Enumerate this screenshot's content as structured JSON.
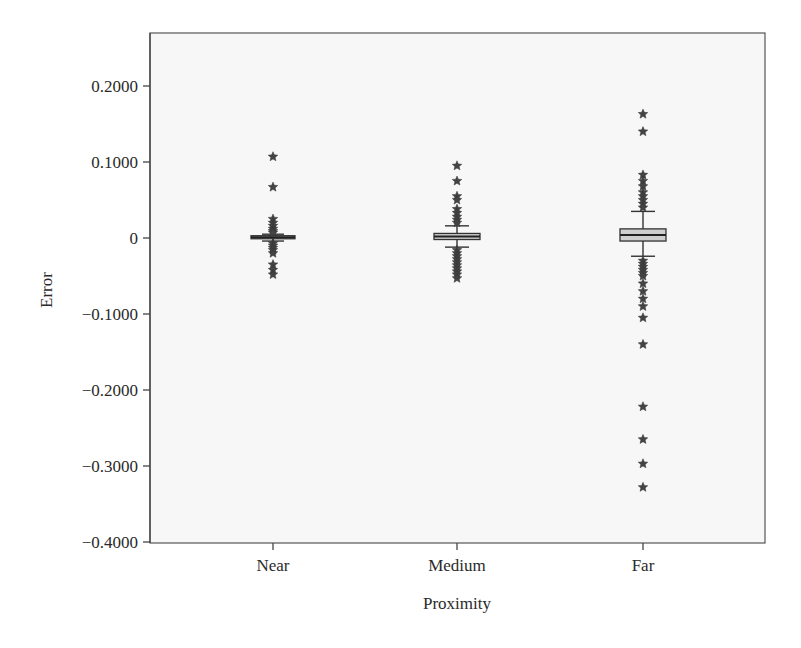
{
  "chart_data": {
    "type": "box",
    "title": "",
    "xlabel": "Proximity",
    "ylabel": "Error",
    "ylim": [
      -0.4,
      0.25
    ],
    "yticks": [
      0.2,
      0.1,
      0,
      -0.1,
      -0.2,
      -0.3,
      -0.4
    ],
    "ytick_labels": [
      "0.2000",
      "0.1000",
      "0",
      "−0.1000",
      "−0.2000",
      "−0.3000",
      "−0.4000"
    ],
    "grid": false,
    "legend": null,
    "categories": [
      "Near",
      "Medium",
      "Far"
    ],
    "series": [
      {
        "name": "Near",
        "whisker_low": -0.004,
        "q1": -0.001,
        "median": 0.001,
        "q3": 0.003,
        "whisker_high": 0.005,
        "outliers": [
          0.107,
          0.067,
          0.025,
          0.02,
          0.016,
          0.012,
          0.009,
          0.007,
          -0.007,
          -0.01,
          -0.013,
          -0.016,
          -0.02,
          -0.035,
          -0.042,
          -0.048
        ]
      },
      {
        "name": "Medium",
        "whisker_low": -0.012,
        "q1": -0.002,
        "median": 0.002,
        "q3": 0.006,
        "whisker_high": 0.016,
        "outliers": [
          0.095,
          0.075,
          0.055,
          0.05,
          0.038,
          0.033,
          0.028,
          0.024,
          0.02,
          -0.016,
          -0.02,
          -0.024,
          -0.028,
          -0.032,
          -0.036,
          -0.04,
          -0.044,
          -0.048,
          -0.053
        ]
      },
      {
        "name": "Far",
        "whisker_low": -0.024,
        "q1": -0.004,
        "median": 0.004,
        "q3": 0.012,
        "whisker_high": 0.035,
        "outliers": [
          0.163,
          0.14,
          0.083,
          0.075,
          0.068,
          0.06,
          0.055,
          0.05,
          0.045,
          0.04,
          -0.03,
          -0.034,
          -0.038,
          -0.042,
          -0.046,
          -0.05,
          -0.06,
          -0.07,
          -0.08,
          -0.09,
          -0.105,
          -0.14,
          -0.222,
          -0.265,
          -0.297,
          -0.328
        ]
      }
    ]
  },
  "colors": {
    "plot_bg": "#f7f7f7",
    "frame": "#555555",
    "box_fill": "#cfcfcf",
    "marker": "#444444"
  }
}
